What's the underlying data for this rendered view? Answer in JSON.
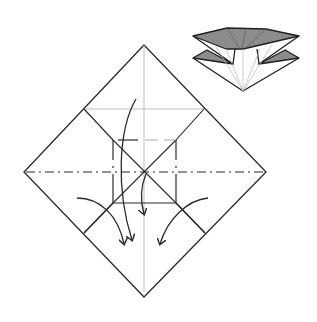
{
  "diagram": {
    "type": "origami-fold-step",
    "description": "Origami folding step: square paper shown as diamond with creases, dash-dot fold lines, and curved arrows indicating folds toward the bottom; inset preview of resulting folded model at top right.",
    "colors": {
      "line": "#2a2a2a",
      "crease": "#b8b8b8",
      "shade": "#8c8c8c",
      "background": "#ffffff"
    },
    "main_diamond": {
      "top": [
        144,
        45
      ],
      "right": [
        266,
        172
      ],
      "bottom": [
        144,
        297
      ],
      "left": [
        24,
        172
      ]
    },
    "center": [
      145,
      171
    ],
    "inner_square": {
      "x1": 113,
      "y1": 140,
      "x2": 176,
      "y2": 203
    },
    "arrows": [
      {
        "name": "arrow-long-left",
        "direction": "down"
      },
      {
        "name": "arrow-center",
        "direction": "down"
      },
      {
        "name": "arrow-left-corner",
        "direction": "down-right"
      },
      {
        "name": "arrow-right-corner",
        "direction": "down-left"
      }
    ],
    "preview": {
      "label": "result-preview"
    }
  }
}
